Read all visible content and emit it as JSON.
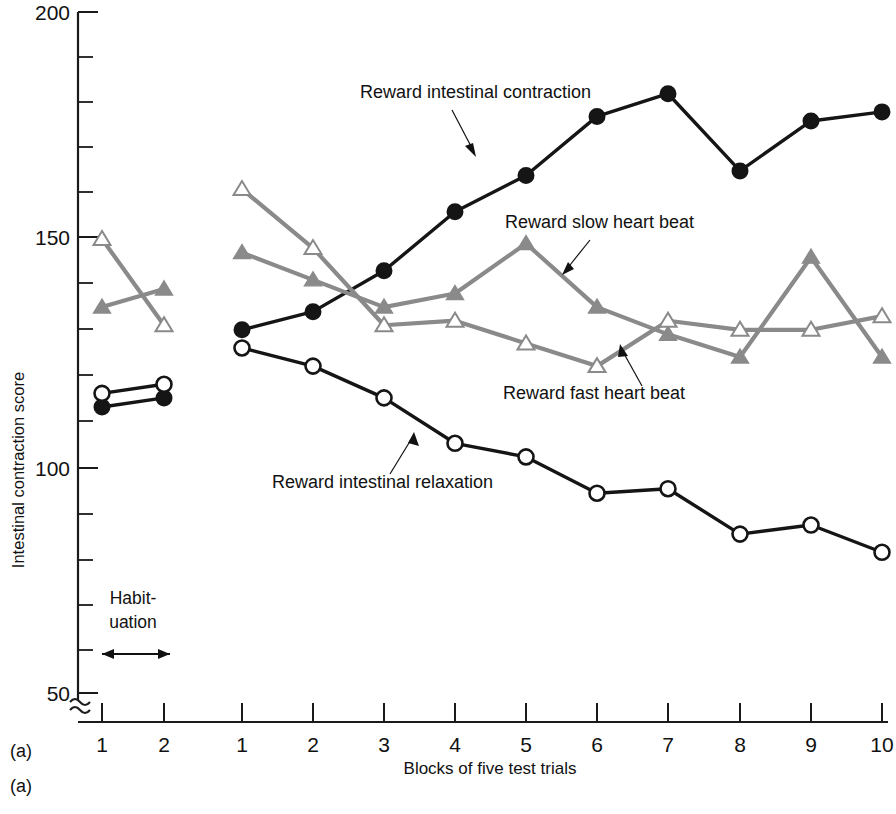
{
  "figure": {
    "panel_label_top": "(a)",
    "panel_label_bottom": "(a)",
    "habituation_label_line1": "Habit-",
    "habituation_label_line2": "uation"
  },
  "chart_data": {
    "type": "line",
    "title": "",
    "xlabel": "Blocks of five test trials",
    "ylabel": "Intestinal contraction score",
    "ylim": [
      50,
      200
    ],
    "ytick_labels": [
      "200",
      "150",
      "100",
      "50"
    ],
    "ytick_values": [
      200,
      150,
      100,
      50
    ],
    "y_minor_step": 10,
    "grid": false,
    "axis_break": true,
    "legend_position": "inline-annotations",
    "habituation_x_labels": [
      "1",
      "2"
    ],
    "test_x_labels": [
      "1",
      "2",
      "3",
      "4",
      "5",
      "6",
      "7",
      "8",
      "9",
      "10"
    ],
    "habituation": {
      "x": [
        1,
        2
      ],
      "series": [
        {
          "name": "Reward intestinal contraction",
          "marker": "filled-circle",
          "color": "#151515",
          "values": [
            113,
            115
          ]
        },
        {
          "name": "Reward intestinal relaxation",
          "marker": "open-circle",
          "color": "#151515",
          "values": [
            116,
            118
          ]
        },
        {
          "name": "Reward slow heart beat",
          "marker": "filled-triangle",
          "color": "#8a8a8a",
          "values": [
            135,
            139
          ]
        },
        {
          "name": "Reward fast heart beat",
          "marker": "open-triangle",
          "color": "#8a8a8a",
          "values": [
            150,
            131
          ]
        }
      ]
    },
    "categories": [
      1,
      2,
      3,
      4,
      5,
      6,
      7,
      8,
      9,
      10
    ],
    "series": [
      {
        "name": "Reward intestinal contraction",
        "marker": "filled-circle",
        "color": "#151515",
        "values": [
          130,
          134,
          143,
          156,
          164,
          177,
          182,
          165,
          176,
          178
        ]
      },
      {
        "name": "Reward intestinal relaxation",
        "marker": "open-circle",
        "color": "#151515",
        "values": [
          126,
          122,
          115,
          105,
          102,
          94,
          95,
          85,
          87,
          81
        ]
      },
      {
        "name": "Reward slow heart beat",
        "marker": "filled-triangle",
        "color": "#8a8a8a",
        "values": [
          147,
          141,
          135,
          138,
          149,
          135,
          129,
          124,
          146,
          124
        ]
      },
      {
        "name": "Reward fast heart beat",
        "marker": "open-triangle",
        "color": "#8a8a8a",
        "values": [
          161,
          148,
          131,
          132,
          127,
          122,
          132,
          130,
          130,
          133
        ]
      }
    ],
    "annotations": [
      {
        "text": "Reward intestinal contraction",
        "target_series": "Reward intestinal contraction"
      },
      {
        "text": "Reward slow heart beat",
        "target_series": "Reward slow heart beat"
      },
      {
        "text": "Reward fast heart beat",
        "target_series": "Reward fast heart beat"
      },
      {
        "text": "Reward intestinal relaxation",
        "target_series": "Reward intestinal relaxation"
      }
    ]
  }
}
